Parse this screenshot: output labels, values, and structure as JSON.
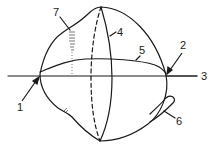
{
  "diagram": {
    "type": "labeled-sphere-illustration",
    "stroke_color": "#1a1a1a",
    "background": "#ffffff",
    "labels": [
      {
        "id": "1",
        "text": "1",
        "x": 17,
        "y": 111,
        "points_to": "left-pole-arrow"
      },
      {
        "id": "2",
        "text": "2",
        "x": 180,
        "y": 49,
        "points_to": "right-pole-arrow"
      },
      {
        "id": "3",
        "text": "3",
        "x": 203,
        "y": 80,
        "points_to": "horizontal-axis-line"
      },
      {
        "id": "4",
        "text": "4",
        "x": 118,
        "y": 36,
        "points_to": "solid-meridian"
      },
      {
        "id": "5",
        "text": "5",
        "x": 140,
        "y": 54,
        "points_to": "equator-curve"
      },
      {
        "id": "6",
        "text": "6",
        "x": 176,
        "y": 125,
        "points_to": "appendage-tube"
      },
      {
        "id": "7",
        "text": "7",
        "x": 54,
        "y": 16,
        "points_to": "hatched-region"
      }
    ]
  }
}
